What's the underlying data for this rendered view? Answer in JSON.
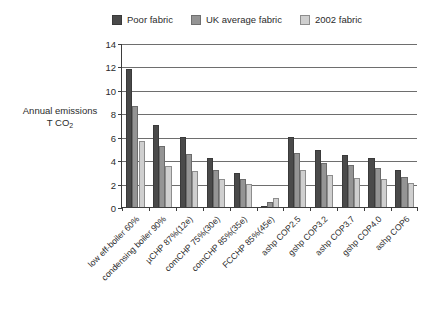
{
  "chart_data": {
    "type": "bar",
    "title": "",
    "xlabel": "",
    "ylabel": "Annual emissions T CO2",
    "ylim": [
      0,
      14
    ],
    "yticks": [
      0,
      2,
      4,
      6,
      8,
      10,
      12,
      14
    ],
    "grid": true,
    "legend_position": "top",
    "categories": [
      "low eff-boiler 60%",
      "condensing boiler 90%",
      "µCHP 87%(12e)",
      "comCHP 75%(30e)",
      "comCHP 85%(35e)",
      "FCCHP 85%(45e)",
      "ashp COP2.5",
      "gshp COP3.2",
      "ashp COP3.7",
      "gshp COP4.0",
      "ashp COP6"
    ],
    "series": [
      {
        "name": "Poor fabric",
        "color": "#4a4a4a",
        "values": [
          11.8,
          7.0,
          6.0,
          4.15,
          2.9,
          0.1,
          6.0,
          4.9,
          4.45,
          4.2,
          3.2
        ]
      },
      {
        "name": "UK average fabric",
        "color": "#949494",
        "values": [
          8.6,
          5.25,
          4.5,
          3.2,
          2.4,
          0.45,
          4.6,
          3.8,
          3.55,
          3.3,
          2.6
        ]
      },
      {
        "name": "2002 fabric",
        "color": "#cfcfcf",
        "values": [
          5.6,
          3.5,
          3.1,
          2.35,
          2.0,
          0.8,
          3.2,
          2.7,
          2.5,
          2.4,
          2.05
        ]
      }
    ]
  },
  "legend": {
    "items": [
      {
        "label": "Poor fabric"
      },
      {
        "label": "UK average fabric"
      },
      {
        "label": "2002 fabric"
      }
    ]
  },
  "axis": {
    "y_title_line1": "Annual emissions",
    "y_title_line2_prefix": "T CO",
    "y_title_line2_sub": "2"
  }
}
